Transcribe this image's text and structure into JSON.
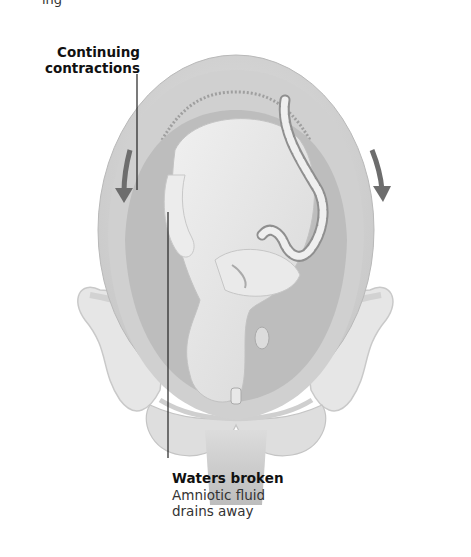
{
  "page_fragment_top": "ing",
  "labels": {
    "contractions": {
      "title_line1": "Continuing",
      "title_line2": "contractions"
    },
    "waters": {
      "title": "Waters broken",
      "desc_line1": "Amniotic fluid",
      "desc_line2": "drains away"
    }
  },
  "illustration": {
    "subject": "uterus-with-fetus-in-pelvis",
    "arrows": [
      "down-arrow-left",
      "down-arrow-right"
    ],
    "colors": {
      "uterus_outer": "#d9d9d9",
      "uterus_wall": "#c4c4c4",
      "amniotic_space": "#bdbdbd",
      "fetus": "#e6e6e6",
      "pelvis": "#e4e4e4",
      "arrow": "#6d6d6d",
      "leader_line": "#222222"
    }
  }
}
